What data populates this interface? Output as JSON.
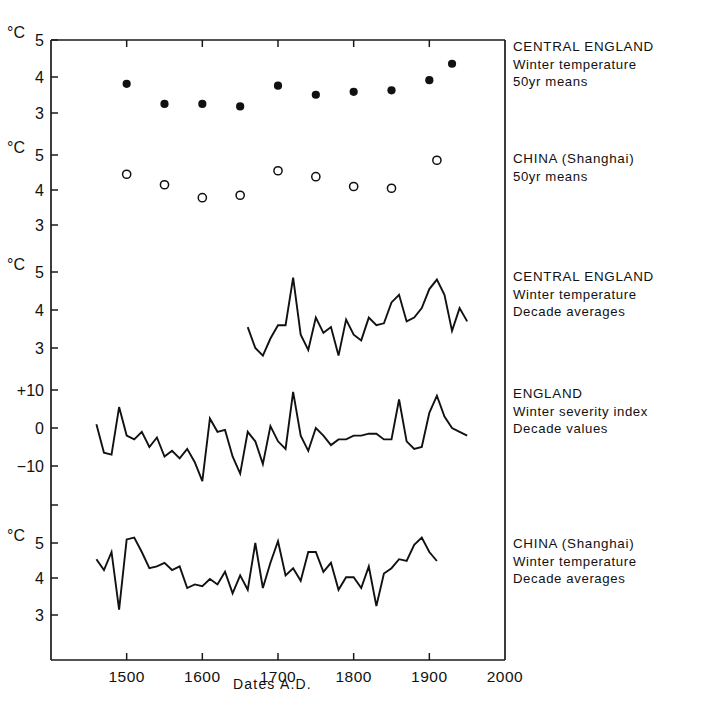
{
  "figure": {
    "xlabel": "Dates  A.D.",
    "x_ticks": [
      1500,
      1600,
      1700,
      1800,
      1900,
      2000
    ],
    "x_range": [
      1400,
      2000
    ],
    "degree_symbol": "°C"
  },
  "panels": [
    {
      "id": "central-england-50yr",
      "legend_title": "CENTRAL ENGLAND",
      "legend_line2": "Winter temperature",
      "legend_line3": "50yr means",
      "unit_label": "°C",
      "y_ticks": [
        5,
        4,
        3
      ],
      "marker": "filled-circle"
    },
    {
      "id": "china-shanghai-50yr",
      "legend_title": "CHINA (Shanghai)",
      "legend_line2": "50yr means",
      "legend_line3": "",
      "unit_label": "°C",
      "y_ticks": [
        5,
        4,
        3
      ],
      "marker": "open-circle"
    },
    {
      "id": "central-england-decade",
      "legend_title": "CENTRAL ENGLAND",
      "legend_line2": "Winter temperature",
      "legend_line3": "Decade averages",
      "unit_label": "°C",
      "y_ticks": [
        5,
        4,
        3
      ],
      "marker": "line"
    },
    {
      "id": "england-severity-index",
      "legend_title": "ENGLAND",
      "legend_line2": "Winter severity index",
      "legend_line3": "Decade values",
      "unit_label": "",
      "y_ticks": [
        "+10",
        "0",
        "−10"
      ],
      "marker": "line"
    },
    {
      "id": "china-shanghai-decade",
      "legend_title": "CHINA (Shanghai)",
      "legend_line2": "Winter temperature",
      "legend_line3": "Decade averages",
      "unit_label": "°C",
      "y_ticks": [
        5,
        4,
        3
      ],
      "marker": "line"
    }
  ],
  "chart_data": [
    {
      "type": "scatter",
      "title": "CENTRAL ENGLAND Winter temperature 50yr means",
      "xlabel": "Dates A.D.",
      "ylabel": "°C",
      "xlim": [
        1400,
        2000
      ],
      "ylim": [
        2.6,
        5.2
      ],
      "yticks": [
        3,
        4,
        5
      ],
      "marker": "filled-circle",
      "x": [
        1500,
        1550,
        1600,
        1650,
        1700,
        1750,
        1800,
        1850,
        1900,
        1930
      ],
      "y": [
        3.8,
        3.25,
        3.25,
        3.18,
        3.75,
        3.5,
        3.58,
        3.62,
        3.9,
        4.35
      ]
    },
    {
      "type": "scatter",
      "title": "CHINA (Shanghai) 50yr means",
      "xlabel": "Dates A.D.",
      "ylabel": "°C",
      "xlim": [
        1400,
        2000
      ],
      "ylim": [
        2.6,
        5.2
      ],
      "yticks": [
        3,
        4,
        5
      ],
      "marker": "open-circle",
      "x": [
        1500,
        1550,
        1600,
        1650,
        1700,
        1750,
        1800,
        1850,
        1910
      ],
      "y": [
        4.45,
        4.15,
        3.78,
        3.85,
        4.55,
        4.38,
        4.1,
        4.05,
        4.85
      ]
    },
    {
      "type": "line",
      "title": "CENTRAL ENGLAND Winter temperature Decade averages",
      "xlabel": "Dates A.D.",
      "ylabel": "°C",
      "xlim": [
        1400,
        2000
      ],
      "ylim": [
        2.6,
        5.2
      ],
      "yticks": [
        3,
        4,
        5
      ],
      "x": [
        1660,
        1670,
        1680,
        1690,
        1700,
        1710,
        1720,
        1730,
        1740,
        1750,
        1760,
        1770,
        1780,
        1790,
        1800,
        1810,
        1820,
        1830,
        1840,
        1850,
        1860,
        1870,
        1880,
        1890,
        1900,
        1910,
        1920,
        1930,
        1940,
        1950
      ],
      "y": [
        3.55,
        3.0,
        2.8,
        3.25,
        3.6,
        3.6,
        4.85,
        3.35,
        2.95,
        3.8,
        3.4,
        3.55,
        2.8,
        3.75,
        3.35,
        3.2,
        3.8,
        3.6,
        3.65,
        4.2,
        4.4,
        3.7,
        3.8,
        4.05,
        4.55,
        4.8,
        4.4,
        3.45,
        4.05,
        3.7
      ]
    },
    {
      "type": "line",
      "title": "ENGLAND Winter severity index Decade values",
      "xlabel": "Dates A.D.",
      "ylabel": "index",
      "xlim": [
        1400,
        2000
      ],
      "ylim": [
        -17,
        13
      ],
      "yticks": [
        -10,
        0,
        10
      ],
      "x": [
        1460,
        1470,
        1480,
        1490,
        1500,
        1510,
        1520,
        1530,
        1540,
        1550,
        1560,
        1570,
        1580,
        1590,
        1600,
        1610,
        1620,
        1630,
        1640,
        1650,
        1660,
        1670,
        1680,
        1690,
        1700,
        1710,
        1720,
        1730,
        1740,
        1750,
        1760,
        1770,
        1780,
        1790,
        1800,
        1810,
        1820,
        1830,
        1840,
        1850,
        1860,
        1870,
        1880,
        1890,
        1900,
        1910,
        1920,
        1930,
        1940,
        1950
      ],
      "y": [
        1.0,
        -6.5,
        -7.0,
        5.5,
        -2.0,
        -3.0,
        -1.0,
        -5.0,
        -2.5,
        -7.5,
        -6.0,
        -8.0,
        -5.5,
        -9.0,
        -14.0,
        2.5,
        -1.0,
        -0.5,
        -7.5,
        -12.0,
        -1.0,
        -3.5,
        -9.5,
        0.5,
        -3.5,
        -5.5,
        9.5,
        -2.0,
        -6.0,
        0.0,
        -2.0,
        -4.5,
        -3.0,
        -3.0,
        -2.0,
        -2.0,
        -1.5,
        -1.5,
        -3.0,
        -3.0,
        7.5,
        -3.5,
        -5.5,
        -5.0,
        4.0,
        8.5,
        3.0,
        0.0,
        -1.0,
        -2.0
      ]
    },
    {
      "type": "line",
      "title": "CHINA (Shanghai) Winter temperature Decade averages",
      "xlabel": "Dates A.D.",
      "ylabel": "°C",
      "xlim": [
        1400,
        2000
      ],
      "ylim": [
        2.6,
        5.3
      ],
      "yticks": [
        3,
        4,
        5
      ],
      "x": [
        1460,
        1470,
        1480,
        1490,
        1500,
        1510,
        1520,
        1530,
        1540,
        1550,
        1560,
        1570,
        1580,
        1590,
        1600,
        1610,
        1620,
        1630,
        1640,
        1650,
        1660,
        1670,
        1680,
        1690,
        1700,
        1710,
        1720,
        1730,
        1740,
        1750,
        1760,
        1770,
        1780,
        1790,
        1800,
        1810,
        1820,
        1830,
        1840,
        1850,
        1860,
        1870,
        1880,
        1890,
        1900,
        1910,
        1920,
        1930,
        1940,
        1950
      ],
      "y": [
        4.55,
        4.25,
        4.75,
        3.15,
        5.1,
        5.15,
        4.75,
        4.3,
        4.35,
        4.45,
        4.25,
        4.35,
        3.75,
        3.85,
        3.8,
        4.0,
        3.85,
        4.2,
        3.6,
        4.1,
        3.7,
        5.0,
        3.75,
        4.45,
        5.05,
        4.1,
        4.3,
        3.95,
        4.75,
        4.75,
        4.2,
        4.45,
        3.7,
        4.05,
        4.05,
        3.75,
        4.35,
        3.25,
        4.15,
        4.3,
        4.55,
        4.5,
        4.95,
        5.15,
        4.75,
        4.5
      ]
    }
  ]
}
